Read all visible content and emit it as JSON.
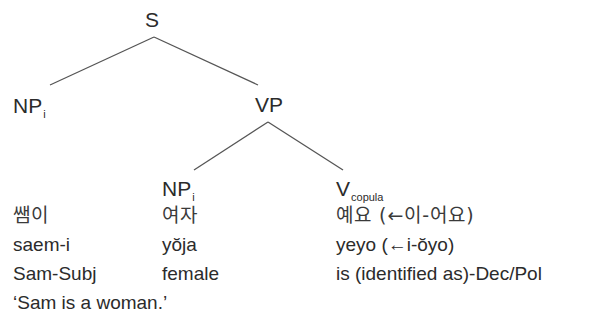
{
  "tree": {
    "root": {
      "label": "S"
    },
    "subject": {
      "label": "NP",
      "index": "i"
    },
    "predicate": {
      "label": "VP"
    },
    "predicate_np": {
      "label": "NP",
      "index": "i"
    },
    "copula": {
      "label": "V",
      "subscript": "copula"
    }
  },
  "gloss": {
    "korean": [
      "쌤이",
      "여자",
      "예요 (←이-어요)"
    ],
    "romanization": [
      "saem-i",
      "yŏja",
      "yeyo (←i-ŏyo)"
    ],
    "morpheme_gloss": [
      "Sam-Subj",
      "female",
      "is (identified as)-Dec/Pol"
    ],
    "translation": "‘Sam is a woman.’"
  },
  "colors": {
    "text": "#2b2b2b",
    "lines": "#555555",
    "background": "#ffffff"
  }
}
